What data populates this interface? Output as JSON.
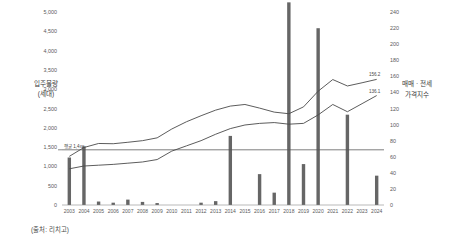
{
  "source_note": "(출처: 리치고)",
  "chart_data": {
    "type": "bar",
    "title": "",
    "xlabel": "",
    "ylabel": "입주물량\n(세대)",
    "y_left_label_line1": "입주물량",
    "y_left_label_line2": "(세대)",
    "y_right_label_line1": "매매 · 전세",
    "y_right_label_line2": "가격지수",
    "grid": true,
    "legend_position": "none",
    "categories": [
      "2003",
      "2004",
      "2005",
      "2006",
      "2007",
      "2008",
      "2009",
      "2010",
      "2011",
      "2012",
      "2013",
      "2014",
      "2015",
      "2016",
      "2017",
      "2018",
      "2019",
      "2020",
      "2021",
      "2022",
      "2023",
      "2024"
    ],
    "ylim": [
      0,
      5000
    ],
    "y_ticks": [
      0,
      500,
      1000,
      1500,
      2000,
      2500,
      3000,
      3500,
      4000,
      4500,
      5000
    ],
    "y_tick_labels": [
      "0",
      "500",
      "1,000",
      "1,500",
      "2,000",
      "2,500",
      "3,000",
      "3,500",
      "4,000",
      "4,500",
      "5,000"
    ],
    "ylim_right": [
      0,
      240
    ],
    "y_ticks_right": [
      0,
      20,
      40,
      60,
      80,
      100,
      120,
      140,
      160,
      180,
      200,
      220,
      240
    ],
    "y_tick_labels_right": [
      "0",
      "20",
      "40",
      "60",
      "80",
      "100",
      "120",
      "140",
      "160",
      "180",
      "200",
      "220",
      "240"
    ],
    "bars": {
      "name": "입주물량",
      "color": "#666666",
      "values": [
        1230,
        1520,
        90,
        60,
        140,
        80,
        50,
        0,
        0,
        60,
        100,
        1790,
        0,
        800,
        320,
        5250,
        1060,
        4580,
        0,
        2340,
        0,
        760
      ]
    },
    "series": [
      {
        "name": "매매가격지수",
        "color": "#4a4a4a",
        "axis": "right",
        "values": [
          60.5,
          71.5,
          76.5,
          76.2,
          78.0,
          80.0,
          83.5,
          94.5,
          103.5,
          111.0,
          118.0,
          123.0,
          125.0,
          120.5,
          115.5,
          113.5,
          122.0,
          141.5,
          156.0,
          148.0,
          152.0,
          156.2
        ],
        "end_label": "156.2"
      },
      {
        "name": "전세가격지수",
        "color": "#4a4a4a",
        "axis": "right",
        "values": [
          45.0,
          48.5,
          49.5,
          50.5,
          52.0,
          53.5,
          56.5,
          67.0,
          73.5,
          80.0,
          88.0,
          95.0,
          99.5,
          101.5,
          102.5,
          100.5,
          101.5,
          112.0,
          125.0,
          116.0,
          126.0,
          136.1
        ],
        "end_label": "136.1"
      }
    ],
    "annotations": [
      {
        "text": "평균 1,4xx",
        "label": "평균 1,4xx",
        "value": 1430,
        "axis": "left",
        "type": "average-line"
      }
    ]
  }
}
